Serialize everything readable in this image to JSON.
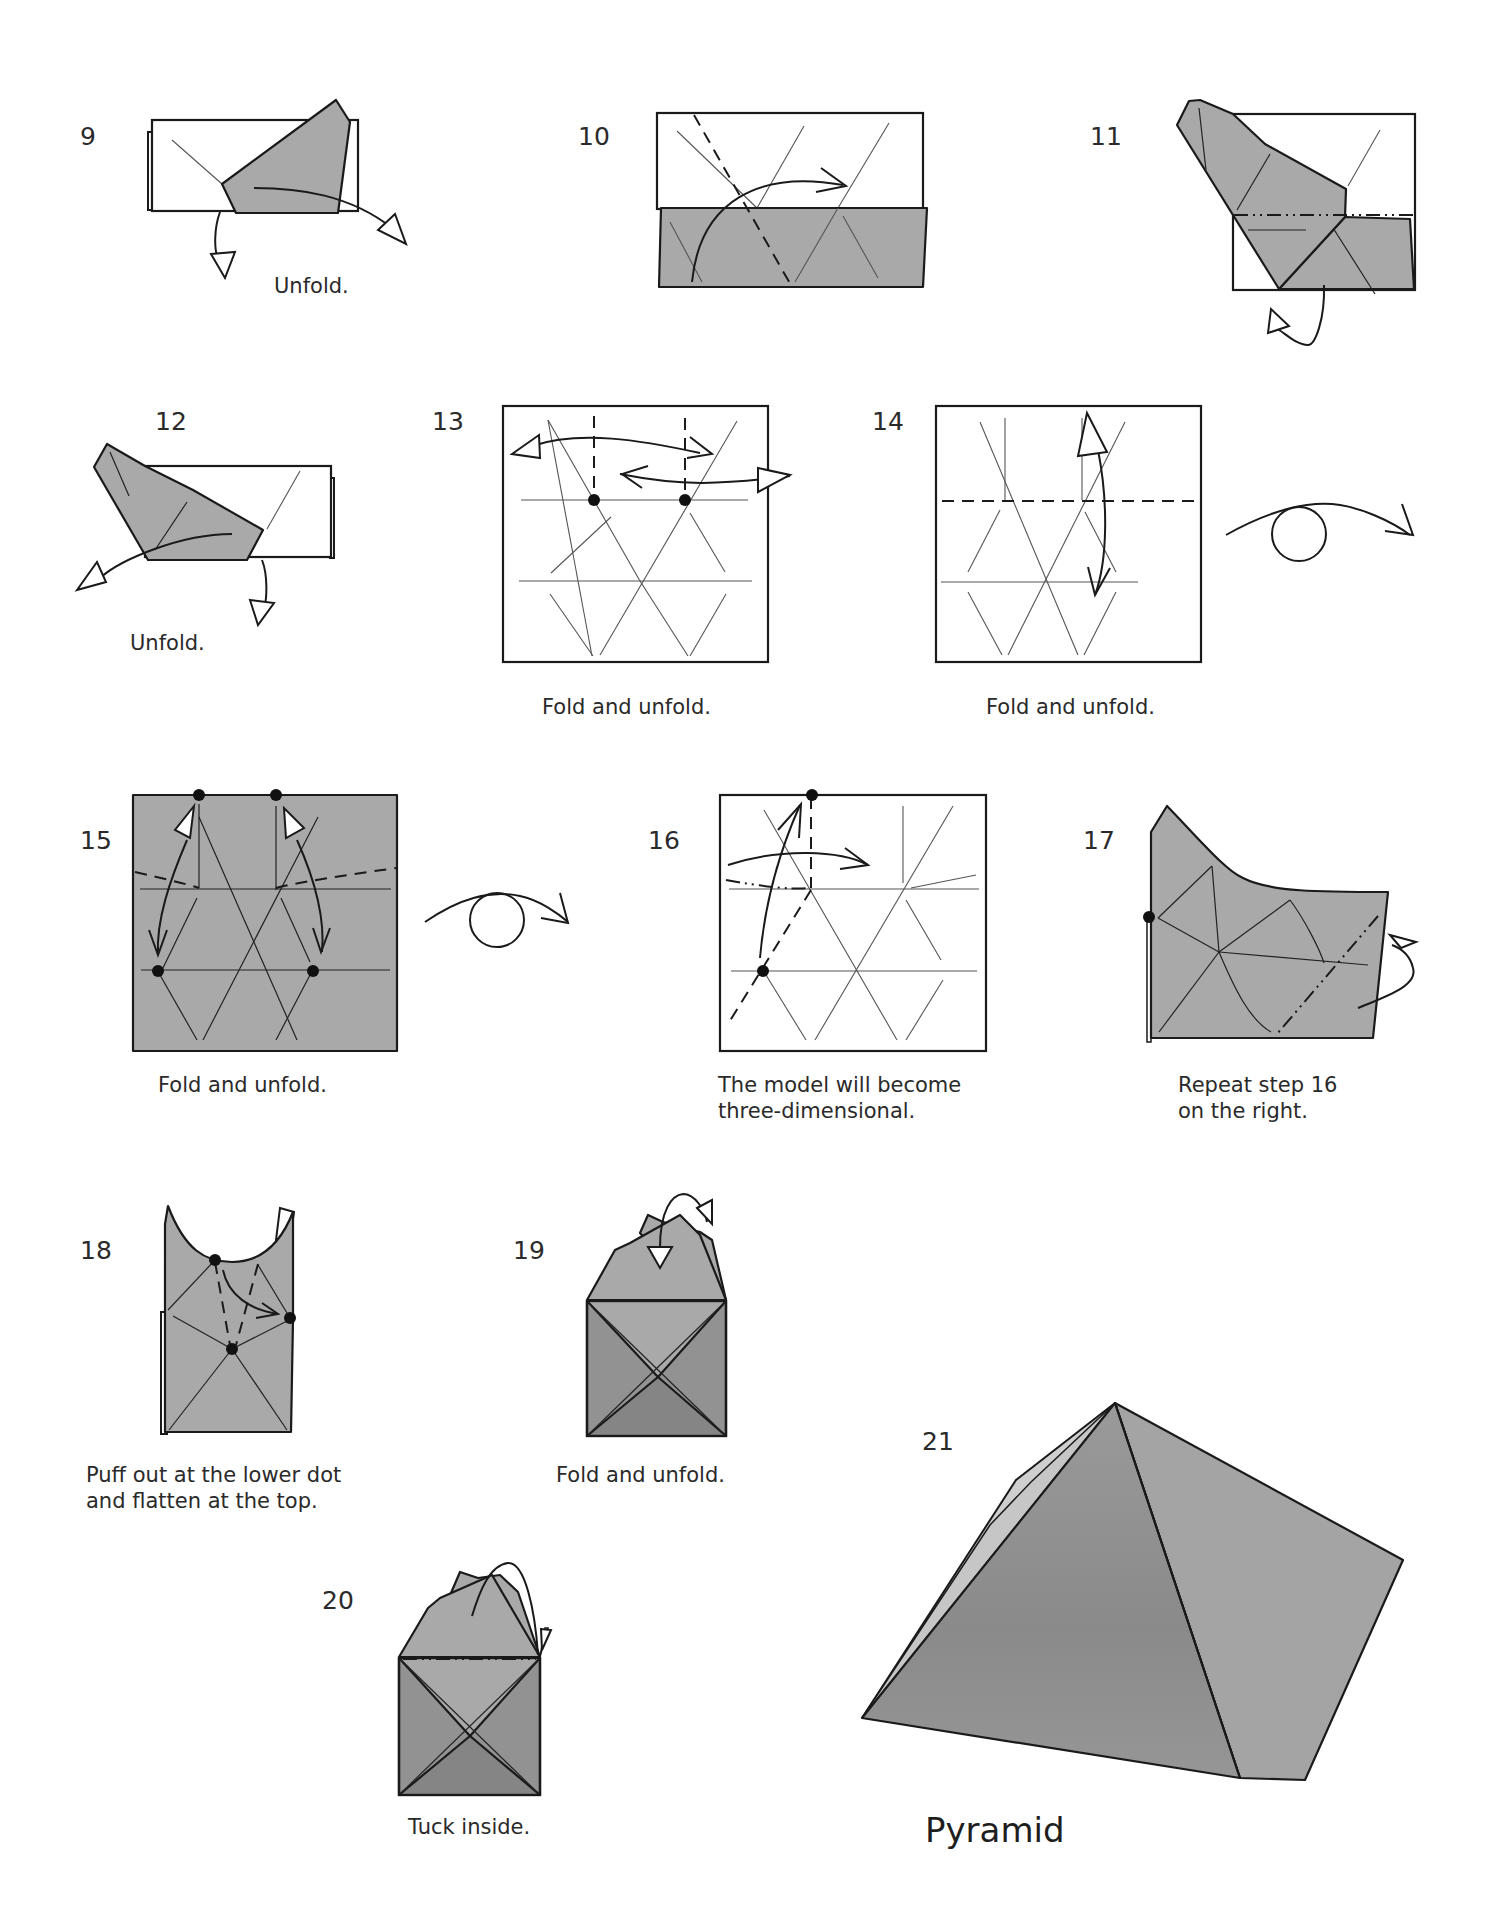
{
  "document": {
    "subject": "Origami pyramid folding instructions",
    "model_title": "Pyramid"
  },
  "colors": {
    "paper_white": "#ffffff",
    "paper_colored": "#a9a9a9",
    "line": "#1a1a1a"
  },
  "steps": [
    {
      "number": "9",
      "caption": "Unfold."
    },
    {
      "number": "10",
      "caption": ""
    },
    {
      "number": "11",
      "caption": ""
    },
    {
      "number": "12",
      "caption": "Unfold."
    },
    {
      "number": "13",
      "caption": "Fold and unfold."
    },
    {
      "number": "14",
      "caption": "Fold and unfold."
    },
    {
      "number": "15",
      "caption": "Fold and unfold."
    },
    {
      "number": "16",
      "caption_line1": "The model will become",
      "caption_line2": "three-dimensional."
    },
    {
      "number": "17",
      "caption_line1": "Repeat step 16",
      "caption_line2": "on the right."
    },
    {
      "number": "18",
      "caption_line1": "Puff out at the lower dot",
      "caption_line2": "and flatten at the top."
    },
    {
      "number": "19",
      "caption": "Fold and unfold."
    },
    {
      "number": "20",
      "caption": "Tuck inside."
    },
    {
      "number": "21",
      "caption": ""
    }
  ],
  "symbols": {
    "turn_over": "turn-over-icon",
    "valley_fold": "valley-fold-line",
    "mountain_fold": "mountain-fold-line",
    "reference_dot": "reference-dot"
  }
}
